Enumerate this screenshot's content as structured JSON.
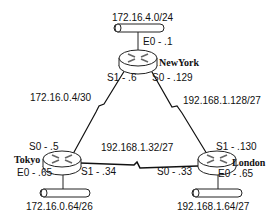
{
  "routers": [
    {
      "name": "NewYork",
      "interfaces": {
        "E0": "E0 - .1",
        "S0": "S0 - .129",
        "S1": "S1 - .6"
      }
    },
    {
      "name": "Tokyo",
      "interfaces": {
        "S0": "S0 - .5",
        "S1": "S1 - .34",
        "E0": "E0 - .65"
      }
    },
    {
      "name": "London",
      "interfaces": {
        "S1": "S1 - .130",
        "S0": "S0 - .33",
        "E0": "E0 - .65"
      }
    }
  ],
  "networks": {
    "newyork_lan": "172.16.4.0/24",
    "tokyo_lan": "172.16.0.64/26",
    "london_lan": "192.168.1.64/27",
    "ny_tokyo_wan": "172.16.0.4/30",
    "ny_london_wan": "192.168.1.128/27",
    "tokyo_london_wan": "192.168.1.32/27"
  }
}
